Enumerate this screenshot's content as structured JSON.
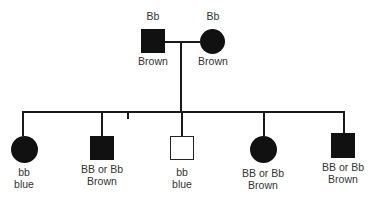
{
  "parents": [
    {
      "id": "father",
      "sex": "male",
      "affected": true,
      "genotype": "Bb",
      "phenotype": "Brown"
    },
    {
      "id": "mother",
      "sex": "female",
      "affected": true,
      "genotype": "Bb",
      "phenotype": "Brown"
    }
  ],
  "children": [
    {
      "id": "child1",
      "sex": "female",
      "filled": true,
      "genotype": "bb",
      "phenotype": "blue"
    },
    {
      "id": "child2",
      "sex": "male",
      "filled": true,
      "genotype": "BB or Bb",
      "phenotype": "Brown"
    },
    {
      "id": "child3",
      "sex": "male",
      "filled": false,
      "genotype": "bb",
      "phenotype": "blue"
    },
    {
      "id": "child4",
      "sex": "female",
      "filled": true,
      "genotype": "BB or Bb",
      "phenotype": "Brown"
    },
    {
      "id": "child5",
      "sex": "male",
      "filled": true,
      "genotype": "BB or Bb",
      "phenotype": "Brown"
    }
  ],
  "colors": {
    "symbol": "#111111",
    "line": "#1a1a1a",
    "text": "#333333"
  }
}
